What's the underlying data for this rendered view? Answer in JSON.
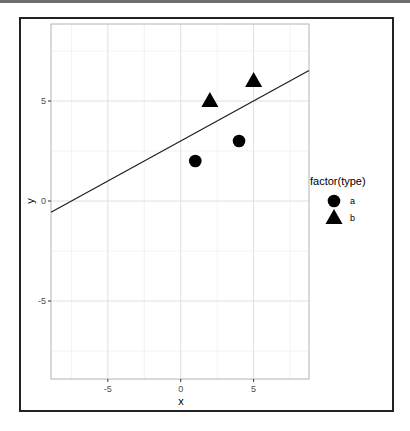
{
  "chart_data": {
    "type": "scatter",
    "title": "",
    "xlabel": "x",
    "ylabel": "y",
    "xlim": [
      -8.9,
      8.8
    ],
    "ylim": [
      -8.9,
      8.85
    ],
    "x_ticks": [
      -5,
      0,
      5
    ],
    "y_ticks": [
      -5,
      0,
      5
    ],
    "x_tick_labels": [
      "-5",
      "0",
      "5"
    ],
    "y_tick_labels": [
      "-5",
      "0",
      "5"
    ],
    "grid": true,
    "minor_grid_x": [
      -7.5,
      -2.5,
      2.5,
      7.5
    ],
    "minor_grid_y": [
      -7.5,
      -2.5,
      2.5,
      7.5
    ],
    "legend": {
      "title": "factor(type)",
      "position": "right",
      "entries": [
        {
          "label": "a",
          "shape": "circle"
        },
        {
          "label": "b",
          "shape": "triangle"
        }
      ]
    },
    "series": [
      {
        "name": "a",
        "shape": "circle",
        "points": [
          {
            "x": 1,
            "y": 2
          },
          {
            "x": 4,
            "y": 3
          }
        ]
      },
      {
        "name": "b",
        "shape": "triangle",
        "points": [
          {
            "x": 2,
            "y": 5
          },
          {
            "x": 5,
            "y": 6
          }
        ]
      }
    ],
    "abline": {
      "intercept": 3,
      "slope": 0.4
    }
  },
  "colors": {
    "points": "#000000",
    "line": "#1a1a1a",
    "grid": "#ebebeb",
    "panel_border": "#b3b3b3"
  }
}
